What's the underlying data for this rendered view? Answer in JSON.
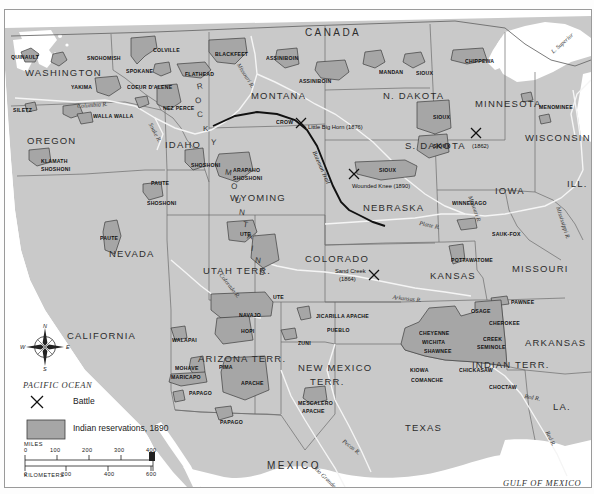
{
  "map": {
    "title_fragment": "",
    "countries": [
      {
        "name": "CANADA",
        "x": 300,
        "y": 17
      },
      {
        "name": "MEXICO",
        "x": 262,
        "y": 450
      }
    ],
    "oceans": [
      {
        "name": "PACIFIC OCEAN",
        "x": 18,
        "y": 370
      },
      {
        "name": "GULF OF MEXICO",
        "x": 498,
        "y": 468
      }
    ],
    "states": [
      {
        "name": "WASHINGTON",
        "x": 20,
        "y": 57
      },
      {
        "name": "OREGON",
        "x": 22,
        "y": 125
      },
      {
        "name": "IDAHO",
        "x": 160,
        "y": 129
      },
      {
        "name": "MONTANA",
        "x": 246,
        "y": 80
      },
      {
        "name": "N. DAKOTA",
        "x": 378,
        "y": 80
      },
      {
        "name": "S. DAKOTA",
        "x": 400,
        "y": 130
      },
      {
        "name": "MINNESOTA",
        "x": 470,
        "y": 88
      },
      {
        "name": "WISCONSIN",
        "x": 520,
        "y": 122
      },
      {
        "name": "ILL.",
        "x": 562,
        "y": 168
      },
      {
        "name": "IOWA",
        "x": 490,
        "y": 175
      },
      {
        "name": "NEBRASKA",
        "x": 358,
        "y": 192
      },
      {
        "name": "WYOMING",
        "x": 225,
        "y": 182
      },
      {
        "name": "NEVADA",
        "x": 104,
        "y": 238
      },
      {
        "name": "UTAH TERR.",
        "x": 198,
        "y": 255
      },
      {
        "name": "COLORADO",
        "x": 300,
        "y": 243
      },
      {
        "name": "KANSAS",
        "x": 425,
        "y": 260
      },
      {
        "name": "MISSOURI",
        "x": 507,
        "y": 253
      },
      {
        "name": "CALIFORNIA",
        "x": 62,
        "y": 320
      },
      {
        "name": "ARIZONA TERR.",
        "x": 193,
        "y": 343
      },
      {
        "name": "NEW MEXICO",
        "x": 293,
        "y": 352
      },
      {
        "name": "TERR.",
        "x": 305,
        "y": 366
      },
      {
        "name": "INDIAN TERR.",
        "x": 467,
        "y": 349
      },
      {
        "name": "ARKANSAS",
        "x": 520,
        "y": 327
      },
      {
        "name": "LA.",
        "x": 548,
        "y": 391
      },
      {
        "name": "TEXAS",
        "x": 400,
        "y": 412
      }
    ],
    "rockies_label": "ROCKY MOUNTAINS",
    "tribes": [
      {
        "name": "QUINAULT",
        "x": 6,
        "y": 44
      },
      {
        "name": "SNOHOMISH",
        "x": 82,
        "y": 45
      },
      {
        "name": "COLVILLE",
        "x": 148,
        "y": 37
      },
      {
        "name": "SPOKANE",
        "x": 121,
        "y": 58
      },
      {
        "name": "YAKIMA",
        "x": 66,
        "y": 74
      },
      {
        "name": "COEUR D'ALENE",
        "x": 122,
        "y": 74
      },
      {
        "name": "FLATHEAD",
        "x": 180,
        "y": 61
      },
      {
        "name": "BLACKFEET",
        "x": 210,
        "y": 41
      },
      {
        "name": "ASSINIBOIN",
        "x": 261,
        "y": 45
      },
      {
        "name": "ASSINIBOIN",
        "x": 294,
        "y": 68
      },
      {
        "name": "MANDAN",
        "x": 374,
        "y": 59
      },
      {
        "name": "SIOUX",
        "x": 411,
        "y": 60
      },
      {
        "name": "CHIPPEWA",
        "x": 460,
        "y": 48
      },
      {
        "name": "MENOMINEE",
        "x": 534,
        "y": 94
      },
      {
        "name": "SILETZ",
        "x": 8,
        "y": 97
      },
      {
        "name": "WALLA WALLA",
        "x": 88,
        "y": 103
      },
      {
        "name": "NEZ PERCE",
        "x": 158,
        "y": 95
      },
      {
        "name": "CROW",
        "x": 271,
        "y": 109
      },
      {
        "name": "SIOUX",
        "x": 428,
        "y": 104
      },
      {
        "name": "SIOUX",
        "x": 428,
        "y": 133
      },
      {
        "name": "SIOUX",
        "x": 374,
        "y": 157
      },
      {
        "name": "KLAMATH",
        "x": 36,
        "y": 148
      },
      {
        "name": "SHOSHONI",
        "x": 36,
        "y": 156
      },
      {
        "name": "SHOSHONI",
        "x": 186,
        "y": 152
      },
      {
        "name": "PAUTE",
        "x": 146,
        "y": 170
      },
      {
        "name": "SHOSHONI",
        "x": 142,
        "y": 190
      },
      {
        "name": "ARAPAHO",
        "x": 228,
        "y": 157
      },
      {
        "name": "SHOSHONI",
        "x": 228,
        "y": 165
      },
      {
        "name": "WINNEBAGO",
        "x": 447,
        "y": 190
      },
      {
        "name": "PAUTE",
        "x": 95,
        "y": 225
      },
      {
        "name": "UTE",
        "x": 235,
        "y": 221
      },
      {
        "name": "SAUK-FOX",
        "x": 487,
        "y": 221
      },
      {
        "name": "POTTAWATOME",
        "x": 446,
        "y": 247
      },
      {
        "name": "UTE",
        "x": 268,
        "y": 284
      },
      {
        "name": "NAVAJO",
        "x": 234,
        "y": 302
      },
      {
        "name": "JICARILLA APACHE",
        "x": 311,
        "y": 303
      },
      {
        "name": "PAWNEE",
        "x": 506,
        "y": 289
      },
      {
        "name": "OSAGE",
        "x": 466,
        "y": 298
      },
      {
        "name": "PUEBLO",
        "x": 322,
        "y": 317
      },
      {
        "name": "CHEROKEE",
        "x": 484,
        "y": 310
      },
      {
        "name": "HOPI",
        "x": 236,
        "y": 318
      },
      {
        "name": "WALAPAI",
        "x": 167,
        "y": 327
      },
      {
        "name": "ZUNI",
        "x": 293,
        "y": 330
      },
      {
        "name": "CHEYENNE",
        "x": 414,
        "y": 320
      },
      {
        "name": "WICHITA",
        "x": 417,
        "y": 329
      },
      {
        "name": "CREEK",
        "x": 478,
        "y": 326
      },
      {
        "name": "SEMINOLE",
        "x": 472,
        "y": 334
      },
      {
        "name": "SHAWNEE",
        "x": 419,
        "y": 338
      },
      {
        "name": "MOHAVE",
        "x": 170,
        "y": 355
      },
      {
        "name": "PIMA",
        "x": 214,
        "y": 354
      },
      {
        "name": "MARICAPO",
        "x": 166,
        "y": 364
      },
      {
        "name": "APACHE",
        "x": 236,
        "y": 370
      },
      {
        "name": "KIOWA",
        "x": 405,
        "y": 357
      },
      {
        "name": "CHICKASAW",
        "x": 454,
        "y": 357
      },
      {
        "name": "COMANCHE",
        "x": 406,
        "y": 367
      },
      {
        "name": "CHOCTAW",
        "x": 484,
        "y": 374
      },
      {
        "name": "MESCALERO",
        "x": 293,
        "y": 390
      },
      {
        "name": "APACHE",
        "x": 297,
        "y": 398
      },
      {
        "name": "PAPAGO",
        "x": 184,
        "y": 380
      },
      {
        "name": "PAPAGO",
        "x": 215,
        "y": 409
      }
    ],
    "battles": [
      {
        "name": "Little Big Horn (1876)",
        "x": 303,
        "y": 114,
        "mx": 295,
        "my": 112
      },
      {
        "name": "Wounded Knee (1890)",
        "x": 347,
        "y": 173,
        "mx": 348,
        "my": 163
      },
      {
        "name": "(1862)",
        "x": 467,
        "y": 133,
        "mx": 470,
        "my": 122
      },
      {
        "name": "Sand Creek",
        "x": 330,
        "y": 258,
        "mx": 368,
        "my": 265
      },
      {
        "name": "(1864)",
        "x": 334,
        "y": 266,
        "mx": 368,
        "my": 265
      }
    ],
    "waters": [
      {
        "name": "Columbia R.",
        "x": 72,
        "y": 93,
        "rot": -4
      },
      {
        "name": "Missouri R.",
        "x": 236,
        "y": 52,
        "rot": 58
      },
      {
        "name": "Snake R.",
        "x": 148,
        "y": 112,
        "rot": 62
      },
      {
        "name": "L. Superior",
        "x": 545,
        "y": 40,
        "rot": -42
      },
      {
        "name": "Missouri R.",
        "x": 468,
        "y": 185,
        "rot": 70
      },
      {
        "name": "Mississippi R.",
        "x": 556,
        "y": 196,
        "rot": 72
      },
      {
        "name": "Platte R.",
        "x": 415,
        "y": 210,
        "rot": 12
      },
      {
        "name": "Colorado R.",
        "x": 218,
        "y": 262,
        "rot": 52
      },
      {
        "name": "Arkansas R.",
        "x": 388,
        "y": 284,
        "rot": 6
      },
      {
        "name": "Pecos R.",
        "x": 340,
        "y": 428,
        "rot": 38
      },
      {
        "name": "Rio Grande",
        "x": 312,
        "y": 455,
        "rot": 44
      },
      {
        "name": "Red R.",
        "x": 545,
        "y": 420,
        "rot": 64
      },
      {
        "name": "Red R.",
        "x": 520,
        "y": 383,
        "rot": 10
      }
    ],
    "trail": {
      "name": "Bozeman Trail",
      "x": 312,
      "y": 140,
      "rot": 66
    }
  },
  "legend": {
    "battle_label": "Battle",
    "reservation_label": "Indian reservations, 1890",
    "reservation_color": "#a8a8a8"
  },
  "scale": {
    "miles_label": "MILES",
    "kilometers_label": "KILOMETERS",
    "miles_ticks": [
      "0",
      "100",
      "200",
      "300",
      "400"
    ],
    "km_ticks": [
      "0",
      "200",
      "400",
      "600"
    ]
  },
  "compass": {
    "north": "N",
    "south": "S",
    "east": "E",
    "west": "W"
  },
  "colors": {
    "land": "#c9c9c9",
    "water": "#ffffff",
    "reservation": "#a6a6a6",
    "border": "#6b6b6b",
    "river": "#f2f2f2"
  }
}
